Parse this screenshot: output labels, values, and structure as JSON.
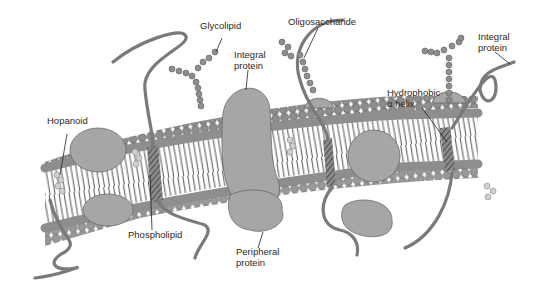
{
  "figure": {
    "type": "diagram",
    "labels": {
      "glycolipid": "Glycolipid",
      "integral_protein_center": "Integral\nprotein",
      "oligosaccharide": "Oligosaccharide",
      "integral_protein_right": "Integral\nprotein",
      "hopanoid": "Hopanoid",
      "hydrophobic_helix": "Hydrophobic\nα helix",
      "phospholipid": "Phospholipid",
      "peripheral_protein": "Peripheral\nprotein"
    },
    "colors": {
      "head": "#8e8e8e",
      "head_stroke": "#5e5e5e",
      "protein": "#a6a6a6",
      "protein_stroke": "#6a6a6a",
      "strand": "#7a7a7a",
      "tail": "#3e3e3e",
      "hopanoid": "#cfcfcf",
      "background": "#ffffff"
    }
  }
}
